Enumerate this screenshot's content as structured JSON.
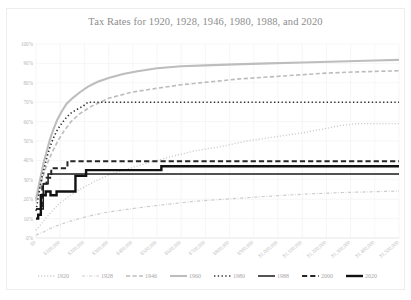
{
  "chart_data": {
    "type": "line",
    "title": "Tax Rates for 1920, 1928, 1946, 1980, 1988, and 2020",
    "xlabel": "",
    "ylabel": "",
    "xlim": [
      0,
      1500000
    ],
    "ylim": [
      0,
      1.0
    ],
    "grid": true,
    "legend_position": "bottom",
    "y_ticks": [
      "0%",
      "10%",
      "20%",
      "30%",
      "40%",
      "50%",
      "60%",
      "70%",
      "80%",
      "90%",
      "100%"
    ],
    "y_tick_values": [
      0,
      10,
      20,
      30,
      40,
      50,
      60,
      70,
      80,
      90,
      100
    ],
    "x_ticks": [
      "$0",
      "$100,000",
      "$200,000",
      "$300,000",
      "$400,000",
      "$500,000",
      "$600,000",
      "$700,000",
      "$800,000",
      "$900,000",
      "$1,000,000",
      "$1,100,000",
      "$1,200,000",
      "$1,300,000",
      "$1,400,000",
      "$1,500,000"
    ],
    "x_tick_values": [
      0,
      100000,
      200000,
      300000,
      400000,
      500000,
      600000,
      700000,
      800000,
      900000,
      1000000,
      1100000,
      1200000,
      1300000,
      1400000,
      1500000
    ],
    "series": [
      {
        "name": "1920",
        "color": "#c9c9c9",
        "style": "dotted",
        "width": 1.3,
        "x": [
          0,
          20000,
          40000,
          60000,
          90000,
          130000,
          180000,
          240000,
          310000,
          390000,
          470000,
          560000,
          660000,
          760000,
          870000,
          980000,
          1090000,
          1180000,
          1260000,
          1330000,
          1400000,
          1500000
        ],
        "y": [
          4,
          7,
          10,
          13,
          17,
          21,
          25,
          29,
          33,
          36,
          39,
          42,
          45,
          47,
          50,
          52,
          54,
          56,
          58,
          59,
          59,
          59
        ]
      },
      {
        "name": "1928",
        "color": "#cccccc",
        "style": "dashdot",
        "width": 1.2,
        "x": [
          0,
          30000,
          60000,
          100000,
          150000,
          210000,
          280000,
          360000,
          450000,
          550000,
          660000,
          780000,
          900000,
          1020000,
          1140000,
          1260000,
          1380000,
          1500000
        ],
        "y": [
          1.5,
          3,
          5,
          7,
          9,
          11,
          13,
          14.5,
          16,
          17.5,
          19,
          20,
          21,
          22,
          22.8,
          23.4,
          23.8,
          24.2
        ]
      },
      {
        "name": "1946",
        "color": "#bcbcbc",
        "style": "dashed",
        "width": 1.6,
        "x": [
          0,
          12000,
          25000,
          40000,
          55000,
          70000,
          90000,
          115000,
          145000,
          180000,
          230000,
          300000,
          390000,
          490000,
          600000,
          720000,
          840000,
          960000,
          1080000,
          1200000,
          1320000,
          1440000,
          1500000
        ],
        "y": [
          19,
          24,
          30,
          36,
          41,
          45,
          50,
          55,
          60,
          64,
          68,
          72,
          75,
          77,
          79,
          80.5,
          82,
          83,
          84,
          85,
          85.6,
          86,
          86.2
        ]
      },
      {
        "name": "1960",
        "color": "#bdbdbd",
        "style": "solid",
        "width": 2.1,
        "x": [
          0,
          10000,
          20000,
          32000,
          45000,
          58000,
          72000,
          88000,
          105000,
          125000,
          150000,
          180000,
          215000,
          255000,
          300000,
          360000,
          420000,
          500000,
          600000,
          700000,
          820000,
          960000,
          1100000,
          1250000,
          1400000,
          1500000
        ],
        "y": [
          20,
          26,
          32,
          39,
          45,
          51,
          56,
          61,
          65,
          69,
          72,
          75,
          78,
          80.5,
          82.5,
          84.5,
          86,
          87.5,
          88.5,
          89,
          89.5,
          90,
          90.5,
          91,
          91.5,
          91.8
        ]
      },
      {
        "name": "1980",
        "color": "#2f2f2f",
        "style": "dotted",
        "width": 1.6,
        "x": [
          0,
          8000,
          16000,
          26000,
          36000,
          46000,
          58000,
          70000,
          85000,
          100000,
          118000,
          140000,
          165000,
          195000,
          215000,
          240000,
          280000,
          340000,
          420000,
          520000,
          640000,
          780000,
          920000,
          1080000,
          1250000,
          1400000,
          1500000
        ],
        "y": [
          14,
          20,
          26,
          32,
          37,
          42,
          47,
          51,
          55,
          58,
          61,
          64,
          66,
          68,
          70,
          70,
          70,
          70,
          70,
          70,
          70,
          70,
          70,
          70,
          70,
          70,
          70
        ]
      },
      {
        "name": "1988",
        "color": "#1a1a1a",
        "style": "solid",
        "width": 1.5,
        "x": [
          0,
          15000,
          30000,
          30000,
          50000,
          50000,
          75000,
          75000,
          160000,
          160000,
          1500000
        ],
        "y": [
          15,
          15,
          15,
          28,
          28,
          33,
          33,
          33,
          33,
          33,
          33
        ]
      },
      {
        "name": "2000",
        "color": "#262626",
        "style": "dashed",
        "width": 2.0,
        "x": [
          0,
          12000,
          26000,
          26000,
          44000,
          44000,
          63000,
          63000,
          100000,
          100000,
          130000,
          130000,
          150000,
          150000,
          290000,
          290000,
          1500000
        ],
        "y": [
          15,
          15,
          15,
          28,
          28,
          31,
          31,
          36,
          36,
          36,
          36,
          39.6,
          39.6,
          39.6,
          39.6,
          39.6,
          39.6
        ]
      },
      {
        "name": "2020",
        "color": "#111111",
        "style": "solid",
        "width": 2.4,
        "x": [
          0,
          9000,
          9000,
          20000,
          20000,
          40000,
          40000,
          60000,
          60000,
          85000,
          85000,
          163000,
          163000,
          207000,
          207000,
          518000,
          518000,
          1500000
        ],
        "y": [
          10,
          10,
          12,
          12,
          22,
          22,
          24,
          24,
          22,
          22,
          24,
          24,
          32,
          32,
          35,
          35,
          37,
          37
        ]
      }
    ]
  },
  "legend": {
    "items": [
      {
        "label": "1920"
      },
      {
        "label": "1928"
      },
      {
        "label": "1946"
      },
      {
        "label": "1960"
      },
      {
        "label": "1980"
      },
      {
        "label": "1988"
      },
      {
        "label": "2000"
      },
      {
        "label": "2020"
      }
    ]
  }
}
